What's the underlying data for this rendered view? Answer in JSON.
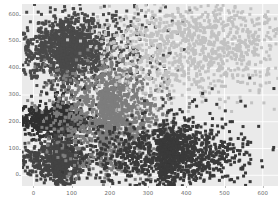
{
  "chart_data": {
    "type": "scatter",
    "title": "",
    "xlabel": "",
    "ylabel": "",
    "xlim": [
      -30,
      640
    ],
    "ylim": [
      -40,
      640
    ],
    "grid": true,
    "legend": null,
    "background_color": "#eaeaea",
    "gridline_color": "#ffffff",
    "tick_color": "#6a6a6a",
    "xticks": [
      0,
      100,
      200,
      300,
      400,
      500,
      600
    ],
    "xtick_labels": [
      "0",
      "100",
      "200",
      "300",
      "400",
      "500",
      "600"
    ],
    "yticks": [
      0,
      100,
      200,
      300,
      400,
      500,
      600
    ],
    "ytick_labels": [
      "0",
      "100",
      "200",
      "300",
      "400",
      "500",
      "600"
    ],
    "marker": "square",
    "marker_size": 3,
    "point_count_total": 6000,
    "series": [
      {
        "name": "cluster-upper-left-dark",
        "color": "#4a4a4a",
        "n": 1500,
        "center": [
          70,
          470
        ],
        "x_spread": 55,
        "y_spread": 62,
        "x_tail": 260,
        "comment": "dense dark block upper-left, fading rightward"
      },
      {
        "name": "cluster-mid-left-darkest",
        "color": "#303030",
        "n": 900,
        "center": [
          55,
          205
        ],
        "x_spread": 48,
        "y_spread": 30,
        "x_tail": 60,
        "comment": "solid near-black rectangular block, y 170-250"
      },
      {
        "name": "cluster-lower-left-dark",
        "color": "#444444",
        "n": 900,
        "center": [
          55,
          55
        ],
        "x_spread": 48,
        "y_spread": 38,
        "x_tail": 60,
        "comment": "dark block bottom-left, y 10-100"
      },
      {
        "name": "cluster-center-medium",
        "color": "#7d7d7d",
        "n": 1400,
        "center": [
          175,
          230
        ],
        "x_spread": 70,
        "y_spread": 95,
        "x_tail": 180,
        "comment": "medium gray mass center of plot"
      },
      {
        "name": "cluster-upper-right-light",
        "color": "#c2c2c2",
        "n": 1100,
        "center": [
          430,
          490
        ],
        "x_spread": 120,
        "y_spread": 95,
        "x_tail": 0,
        "comment": "pale light-gray sparse scatter upper-right"
      },
      {
        "name": "cluster-lower-right-darkest",
        "color": "#3a3a3a",
        "n": 1400,
        "center": [
          330,
          80
        ],
        "x_spread": 95,
        "y_spread": 60,
        "x_tail": 230,
        "comment": "dark scatter lower-right, fading rightward"
      }
    ]
  }
}
